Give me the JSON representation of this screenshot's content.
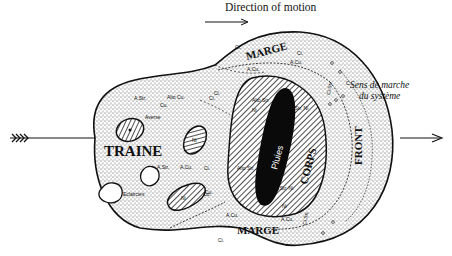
{
  "header": {
    "title": "Direction of motion"
  },
  "diagram": {
    "zones": {
      "traine": "TRAINE",
      "corps": "CORPS",
      "front": "FRONT",
      "marge_top": "MARGE",
      "marge_bottom": "MARGE",
      "pluies": "Pluies"
    },
    "cloud_labels": {
      "a_str_1": "A.Str.",
      "alto_cu": "Alto Cu.",
      "ci_1": "Ci.",
      "cu_1": "Cu.",
      "averse": "Averse",
      "a_str_2": "A.Str.",
      "a_cu_1": "A.Cu.",
      "ci_2": "Ci.",
      "eclaircies": "Eclaircies",
      "cu_2": "Cu.",
      "ni_1": "Ni",
      "ni_2": "Ni",
      "marge_a_cu_1": "A.Cu.",
      "marge_a_cu_2": "A.Cu.",
      "marge_ci_1": "Ci.",
      "marge_ci_2": "Ci.",
      "marge_ci_3": "Ci.",
      "alto_str_1": "Alto Str.",
      "alto_str_2": "Alto Str.",
      "a_str_ni_1": "A.Str. Ni",
      "a_str_ni_2": "A.Str. Ni",
      "corps_ni_1": "Ni",
      "corps_ni_2": "Ni",
      "front_cs": "Ci.Str.",
      "front_c": "C.",
      "bottom_a_cu": "A.Cu.",
      "bottom_cu": "Cu.",
      "bottom_ci": "Ci.",
      "bottom_a_cu_2": "A.Cu.",
      "bottom_cs": "Ci.Str."
    },
    "sens_line1": "Sens de marche",
    "sens_line2": "du système",
    "colors": {
      "ink": "#111111",
      "paper": "#ffffff",
      "stipple": "#444444"
    }
  }
}
